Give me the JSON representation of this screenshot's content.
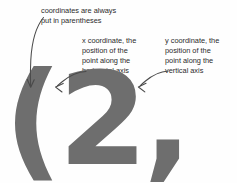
{
  "page": {
    "background_color": "#fefefe",
    "annotation_text_color": "#2b2b2b",
    "glyph_color": "#6e6e6e",
    "arrow_color": "#4a4a4a"
  },
  "figure": {
    "coordinate_pair": "(2, 1)",
    "x_value": "2",
    "y_value": "1"
  },
  "annotations": [
    {
      "id": "parentheses",
      "text": "coordinates are always\nput in parentheses",
      "points_to": "opening-parenthesis"
    },
    {
      "id": "x-coordinate",
      "text": "x coordinate, the\nposition of the\npoint along the\nhorizontal axis",
      "points_to": "digit-2"
    },
    {
      "id": "y-coordinate",
      "text": "y coordinate, the\nposition of the\npoint along the\nvertical axis",
      "points_to": "digit-1"
    }
  ]
}
